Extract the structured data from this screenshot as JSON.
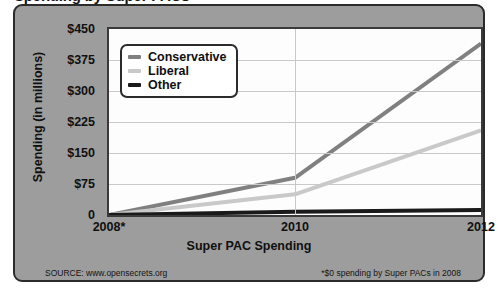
{
  "title": "Spending by Super PACs",
  "footer": {
    "source": "SOURCE: www.opensecrets.org",
    "note": "*$0 spending by Super PACs in 2008"
  },
  "legend": {
    "items": [
      {
        "label": "Conservative",
        "color": "#808080"
      },
      {
        "label": "Liberal",
        "color": "#c9c9c9"
      },
      {
        "label": "Other",
        "color": "#1a1a1a"
      }
    ]
  },
  "chart_data": {
    "type": "line",
    "title": "Spending by Super PACs",
    "xlabel": "Super PAC Spending",
    "ylabel": "Spending (in millions)",
    "categories": [
      "2008*",
      "2010",
      "2012"
    ],
    "x_tick_labels": [
      "2008*",
      "2010",
      "2012"
    ],
    "y_tick_labels": [
      "$450",
      "$375",
      "$300",
      "$225",
      "$150",
      "$75",
      "0"
    ],
    "y_tick_values": [
      450,
      375,
      300,
      225,
      150,
      75,
      0
    ],
    "ylim": [
      0,
      450
    ],
    "grid": true,
    "legend_position": "upper-left-inside",
    "series": [
      {
        "name": "Conservative",
        "color": "#808080",
        "values": [
          0,
          90,
          415
        ]
      },
      {
        "name": "Liberal",
        "color": "#c9c9c9",
        "values": [
          0,
          50,
          205
        ]
      },
      {
        "name": "Other",
        "color": "#1a1a1a",
        "values": [
          0,
          8,
          12
        ]
      }
    ]
  }
}
